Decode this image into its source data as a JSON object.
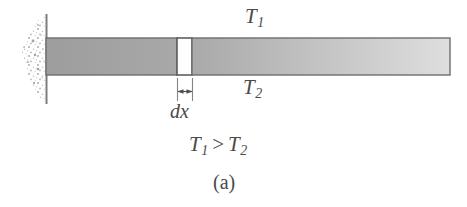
{
  "figure": {
    "caption": "(a)",
    "labels": {
      "t1": {
        "base": "T",
        "sub": "1"
      },
      "t2": {
        "base": "T",
        "sub": "2"
      },
      "dx": "dx",
      "inequality": {
        "left_base": "T",
        "left_sub": "1",
        "operator": ">",
        "right_base": "T",
        "right_sub": "2"
      }
    },
    "colors": {
      "background": "#ffffff",
      "bar_fill_dark": "#a3a3a3",
      "bar_fill_light": "#d8d8d8",
      "bar_border": "#6e6e6e",
      "wall_line": "#7a7a7a",
      "stipple_dot": "#b0b0b0",
      "text": "#4a4a4a",
      "element_fill": "#ffffff"
    },
    "geometry": {
      "wall_line_x": 46,
      "wall_line_top": 14,
      "wall_line_bottom": 104,
      "bar_left": 46,
      "bar_right": 450,
      "bar_top": 38,
      "bar_bottom": 75,
      "element_left": 177,
      "element_right": 192,
      "dim_line_y": 92,
      "dim_ext_top": 78,
      "dim_ext_bottom": 101
    }
  }
}
